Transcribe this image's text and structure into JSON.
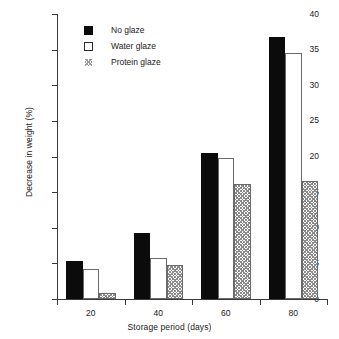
{
  "chart_data": {
    "type": "bar",
    "title": "",
    "subtitle": "",
    "xlabel": "Storage period (days)",
    "ylabel": "Decrease in weight (%)",
    "categories": [
      "20",
      "40",
      "60",
      "80"
    ],
    "series": [
      {
        "name": "No glaze",
        "style": "solid-black",
        "values": [
          5.3,
          9.2,
          20.5,
          36.8
        ]
      },
      {
        "name": "Water glaze",
        "style": "open-white",
        "values": [
          4.2,
          5.7,
          19.8,
          34.5
        ]
      },
      {
        "name": "Protein glaze",
        "style": "hatched-gray",
        "values": [
          0.8,
          4.8,
          16.2,
          16.6
        ]
      }
    ],
    "ylim": [
      0,
      40
    ],
    "yticks": [
      0,
      5,
      10,
      15,
      20,
      25,
      30,
      35,
      40
    ],
    "ytick_labels": [
      "0",
      "5",
      "10",
      "15",
      "20",
      "25",
      "30",
      "35",
      "40"
    ],
    "grid": false,
    "legend_position": "upper-left-inside",
    "annotations": []
  },
  "legend": {
    "items": [
      {
        "label": "No glaze"
      },
      {
        "label": "Water glaze"
      },
      {
        "label": "Protein glaze"
      }
    ]
  },
  "colors": {
    "series_no_glaze": "#0b0b0b",
    "series_water_glaze": "#ffffff",
    "series_protein_glaze": "#8c8c8c",
    "axis": "#3a3a3a",
    "text": "#1a1a1a",
    "background": "#ffffff"
  }
}
